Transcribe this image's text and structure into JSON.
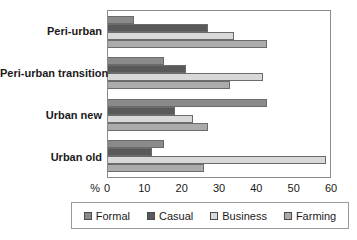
{
  "chart_data": {
    "type": "bar",
    "orientation": "horizontal",
    "title": "",
    "xlabel": "%",
    "ylabel": "",
    "categories": [
      "Peri-urban",
      "Peri-urban transition",
      "Urban new",
      "Urban old"
    ],
    "series": [
      {
        "name": "Formal",
        "color": "#8a8a8a",
        "values": [
          7,
          15,
          43,
          15
        ]
      },
      {
        "name": "Casual",
        "color": "#595959",
        "values": [
          27,
          21,
          18,
          12
        ]
      },
      {
        "name": "Business",
        "color": "#d8d8d8",
        "values": [
          34,
          42,
          23,
          59
        ]
      },
      {
        "name": "Farming",
        "color": "#ababab",
        "values": [
          43,
          33,
          27,
          26
        ]
      }
    ],
    "xlim": [
      0,
      60
    ],
    "xticks": [
      0,
      10,
      20,
      30,
      40,
      50,
      60
    ],
    "grid": false,
    "legend_position": "bottom",
    "plot_border_color": "#8c8c8c",
    "bar_border_color": "#6b6b6b"
  }
}
